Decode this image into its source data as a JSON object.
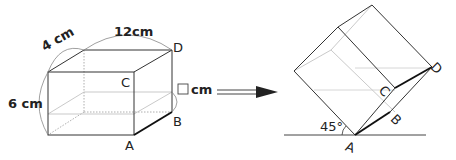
{
  "left_figure": {
    "dimensions": {
      "length": "12cm",
      "width": "4 cm",
      "height": "6 cm",
      "unknown": "cm"
    },
    "vertices": {
      "A": "A",
      "B": "B",
      "C": "C",
      "D": "D"
    }
  },
  "arrow": {
    "direction": "right"
  },
  "right_figure": {
    "angle": "45°",
    "vertices": {
      "A": "A",
      "B": "B",
      "C": "C",
      "D": "D"
    }
  }
}
